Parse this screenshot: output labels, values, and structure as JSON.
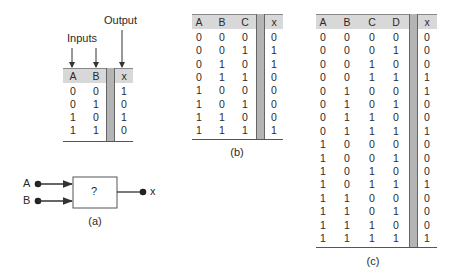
{
  "figure_a": {
    "inputs_label": "Inputs",
    "output_label": "Output",
    "caption": "(a)",
    "table": {
      "headers": [
        "A",
        "B",
        "x"
      ],
      "rows": [
        [
          "0",
          "0",
          "1"
        ],
        [
          "0",
          "1",
          "0"
        ],
        [
          "1",
          "0",
          "1"
        ],
        [
          "1",
          "1",
          "0"
        ]
      ]
    },
    "gate": {
      "input_a": "A",
      "input_b": "B",
      "box_label": "?",
      "output": "x"
    }
  },
  "figure_b": {
    "caption": "(b)",
    "table": {
      "headers": [
        "A",
        "B",
        "C",
        "x"
      ],
      "rows": [
        [
          "0",
          "0",
          "0",
          "0"
        ],
        [
          "0",
          "0",
          "1",
          "1"
        ],
        [
          "0",
          "1",
          "0",
          "1"
        ],
        [
          "0",
          "1",
          "1",
          "0"
        ],
        [
          "1",
          "0",
          "0",
          "0"
        ],
        [
          "1",
          "0",
          "1",
          "0"
        ],
        [
          "1",
          "1",
          "0",
          "0"
        ],
        [
          "1",
          "1",
          "1",
          "1"
        ]
      ]
    }
  },
  "figure_c": {
    "caption": "(c)",
    "table": {
      "headers": [
        "A",
        "B",
        "C",
        "D",
        "x"
      ],
      "rows": [
        [
          "0",
          "0",
          "0",
          "0",
          "0"
        ],
        [
          "0",
          "0",
          "0",
          "1",
          "0"
        ],
        [
          "0",
          "0",
          "1",
          "0",
          "0"
        ],
        [
          "0",
          "0",
          "1",
          "1",
          "1"
        ],
        [
          "0",
          "1",
          "0",
          "0",
          "1"
        ],
        [
          "0",
          "1",
          "0",
          "1",
          "0"
        ],
        [
          "0",
          "1",
          "1",
          "0",
          "0"
        ],
        [
          "0",
          "1",
          "1",
          "1",
          "1"
        ],
        [
          "1",
          "0",
          "0",
          "0",
          "0"
        ],
        [
          "1",
          "0",
          "0",
          "1",
          "0"
        ],
        [
          "1",
          "0",
          "1",
          "0",
          "0"
        ],
        [
          "1",
          "0",
          "1",
          "1",
          "1"
        ],
        [
          "1",
          "1",
          "0",
          "0",
          "0"
        ],
        [
          "1",
          "1",
          "0",
          "1",
          "0"
        ],
        [
          "1",
          "1",
          "1",
          "0",
          "0"
        ],
        [
          "1",
          "1",
          "1",
          "1",
          "1"
        ]
      ]
    }
  }
}
